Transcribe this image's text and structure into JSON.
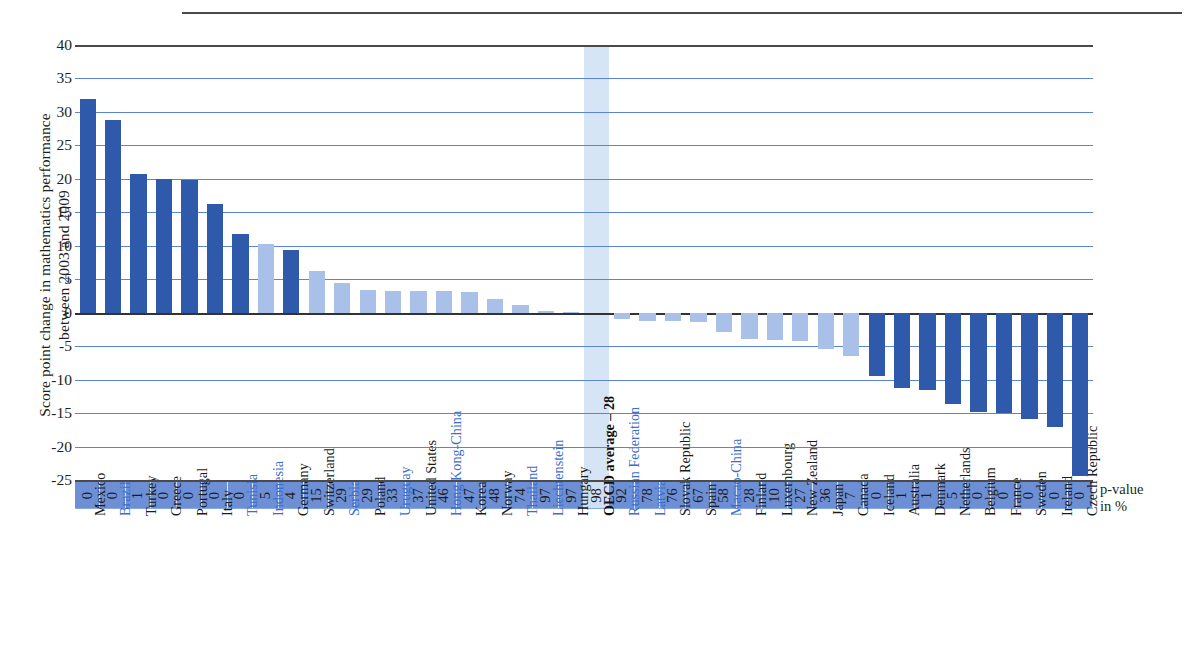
{
  "axis": {
    "y_title": "Score point change in mathematics performance\nbetween 2003 and 2009",
    "y_ticks": [
      40,
      35,
      30,
      25,
      20,
      15,
      10,
      5,
      0,
      -5,
      -10,
      -15,
      -20,
      -25
    ],
    "p_value_label_line1": "p-value",
    "p_value_label_line2": "in %"
  },
  "colors": {
    "bar_dark": "#2f5aab",
    "bar_light": "#a9c1e8",
    "gridline": "#5a84d6",
    "pband": "#6d8fd6",
    "highlight": "#cfe0f4",
    "label_blue": "#3a6ecb",
    "label_dark": "#1b1b1b"
  },
  "chart_data": {
    "type": "bar",
    "title": "",
    "xlabel": "",
    "ylabel": "Score point change in mathematics performance between 2003 and 2009",
    "ylim": [
      -25,
      40
    ],
    "ytick_step": 5,
    "grid": true,
    "legend": "none",
    "categories": [
      "Mexico",
      "Brazil",
      "Turkey",
      "Greece",
      "Portugal",
      "Italy",
      "Tunisia",
      "Indonesia",
      "Germany",
      "Switzerland",
      "Serbia",
      "Poland",
      "Uruguay",
      "United States",
      "Hong Kong-China",
      "Korea",
      "Norway",
      "Thailand",
      "Liechtenstein",
      "Hungary",
      "OECD average – 28",
      "Russian Federation",
      "Latvia",
      "Slovak Republic",
      "Spain",
      "Macao-China",
      "Finland",
      "Luxembourg",
      "New Zealand",
      "Japan",
      "Canada",
      "Iceland",
      "Australia",
      "Denmark",
      "Netherlands",
      "Belgium",
      "France",
      "Sweden",
      "Ireland",
      "Czech Republic"
    ],
    "values": [
      32.0,
      28.8,
      20.7,
      20.0,
      19.8,
      16.3,
      11.8,
      10.2,
      9.4,
      6.3,
      4.4,
      3.4,
      3.3,
      3.3,
      3.2,
      3.1,
      2.0,
      1.1,
      0.2,
      0.1,
      0.0,
      -1.0,
      -1.2,
      -1.2,
      -1.4,
      -2.9,
      -4.0,
      -4.1,
      -4.3,
      -5.4,
      -6.5,
      -9.4,
      -11.2,
      -11.6,
      -13.6,
      -14.9,
      -15.0,
      -15.9,
      -17.1,
      -24.4
    ],
    "p_values": [
      0,
      0,
      1,
      0,
      0,
      0,
      0,
      5,
      4,
      15,
      29,
      29,
      33,
      37,
      46,
      47,
      48,
      74,
      97,
      97,
      98,
      92,
      78,
      76,
      67,
      58,
      28,
      10,
      27,
      36,
      7,
      0,
      1,
      1,
      5,
      0,
      0,
      0,
      0,
      0
    ],
    "bar_shades": [
      "dark",
      "dark",
      "dark",
      "dark",
      "dark",
      "dark",
      "dark",
      "light",
      "dark",
      "light",
      "light",
      "light",
      "light",
      "light",
      "light",
      "light",
      "light",
      "light",
      "light",
      "light",
      "light",
      "light",
      "light",
      "light",
      "light",
      "light",
      "light",
      "light",
      "light",
      "light",
      "light",
      "dark",
      "dark",
      "dark",
      "dark",
      "dark",
      "dark",
      "dark",
      "dark",
      "dark"
    ],
    "label_colors": [
      "dark",
      "blue",
      "dark",
      "dark",
      "dark",
      "dark",
      "blue",
      "blue",
      "dark",
      "dark",
      "blue",
      "dark",
      "blue",
      "dark",
      "blue",
      "dark",
      "dark",
      "blue",
      "blue",
      "dark",
      "oecd",
      "blue",
      "blue",
      "dark",
      "dark",
      "blue",
      "dark",
      "dark",
      "dark",
      "dark",
      "dark",
      "dark",
      "dark",
      "dark",
      "dark",
      "dark",
      "dark",
      "dark",
      "dark",
      "dark"
    ],
    "highlight_category": "OECD average – 28"
  }
}
